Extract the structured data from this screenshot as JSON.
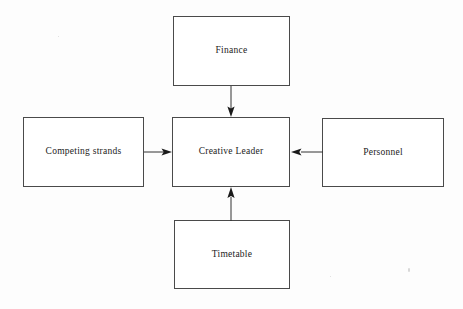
{
  "diagram": {
    "type": "block-diagram",
    "title": "",
    "background_color": "#ffffff",
    "border_color": "#4a4a4a",
    "text_color": "#222222",
    "arrow_color": "#1a1a1a",
    "center_node": "Creative Leader",
    "nodes": [
      {
        "id": "finance",
        "label": "Finance",
        "position": "top"
      },
      {
        "id": "competing",
        "label": "Competing strands",
        "position": "left"
      },
      {
        "id": "creative",
        "label": "Creative Leader",
        "position": "center"
      },
      {
        "id": "personnel",
        "label": "Personnel",
        "position": "right"
      },
      {
        "id": "timetable",
        "label": "Timetable",
        "position": "bottom"
      }
    ],
    "edges": [
      {
        "from": "finance",
        "to": "creative",
        "direction": "down",
        "arrowhead": "at-target"
      },
      {
        "from": "competing",
        "to": "creative",
        "direction": "right",
        "arrowhead": "at-target"
      },
      {
        "from": "personnel",
        "to": "creative",
        "direction": "left",
        "arrowhead": "at-target"
      },
      {
        "from": "timetable",
        "to": "creative",
        "direction": "up",
        "arrowhead": "at-target"
      }
    ]
  }
}
